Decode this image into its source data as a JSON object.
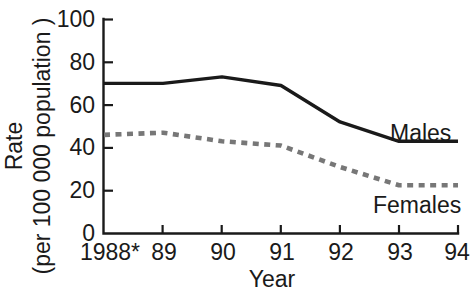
{
  "chart_data": {
    "type": "line",
    "title": "",
    "xlabel": "Year",
    "ylabel": "Rate\n(per 100 000 population )",
    "ylabel_line1": "Rate",
    "ylabel_line2": "(per 100 000 population )",
    "categories": [
      "1988*",
      "89",
      "90",
      "91",
      "92",
      "93",
      "94"
    ],
    "x": [
      1988,
      1989,
      1990,
      1991,
      1992,
      1993,
      1994
    ],
    "series": [
      {
        "name": "Males",
        "style": "solid",
        "color": "#1a1a1a",
        "values": [
          70,
          70,
          73,
          69,
          52,
          43,
          43
        ]
      },
      {
        "name": "Females",
        "style": "dashed",
        "color": "#777777",
        "values": [
          46,
          47,
          43,
          41,
          31,
          22.5,
          22.5
        ]
      }
    ],
    "ylim": [
      0,
      100
    ],
    "yticks": [
      0,
      20,
      40,
      60,
      80,
      100
    ],
    "ytick_labels": [
      "0",
      "20",
      "40",
      "60",
      "80",
      "100"
    ],
    "xtick_labels": [
      "1988*",
      "89",
      "90",
      "91",
      "92",
      "93",
      "94"
    ],
    "grid": false,
    "legend": "inline-series-labels",
    "legend_position": "right-inline",
    "annotations": [
      {
        "text": "Males",
        "series": "Males"
      },
      {
        "text": "Females",
        "series": "Females"
      }
    ]
  }
}
